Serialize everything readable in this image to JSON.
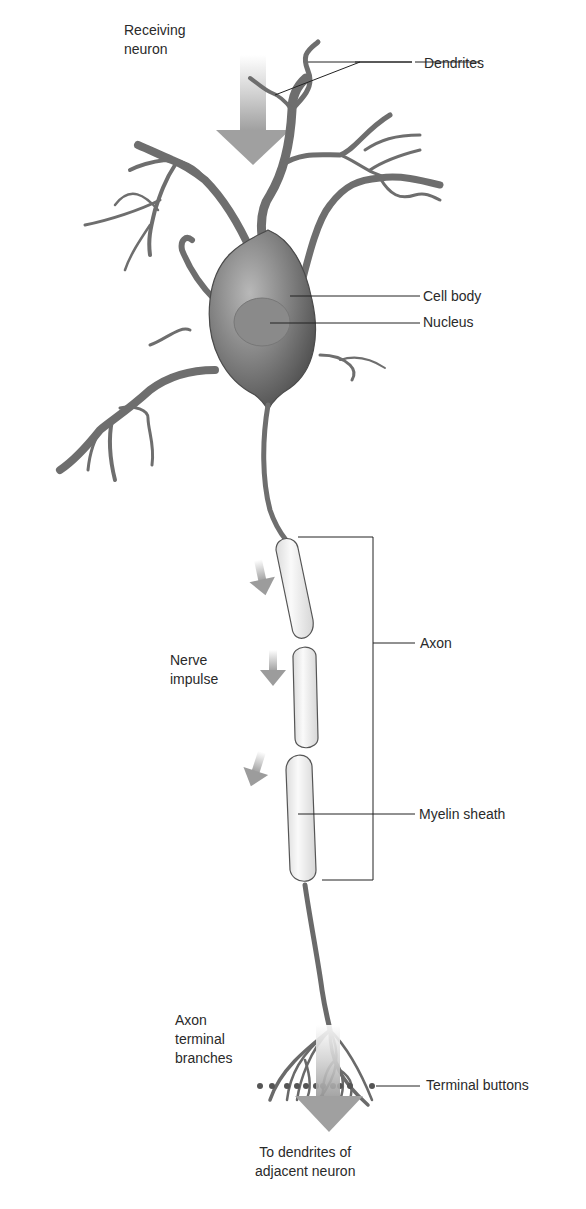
{
  "colors": {
    "neuron_fill": "#7d7d7d",
    "neuron_dark": "#555555",
    "myelin_fill": "#f2f2f2",
    "arrow_gray": "#a8a8a8",
    "leader_line": "#222222",
    "text": "#2a2a2a"
  },
  "labels": {
    "receiving_neuron": [
      "Receiving",
      "neuron"
    ],
    "dendrites": "Dendrites",
    "cell_body": "Cell body",
    "nucleus": "Nucleus",
    "axon": "Axon",
    "nerve_impulse": [
      "Nerve",
      "impulse"
    ],
    "myelin_sheath": "Myelin sheath",
    "axon_terminal_branches": [
      "Axon",
      "terminal",
      "branches"
    ],
    "terminal_buttons": "Terminal buttons",
    "to_dendrites": [
      "To dendrites of",
      "adjacent neuron"
    ]
  }
}
